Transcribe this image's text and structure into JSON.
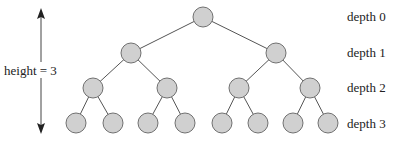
{
  "height_label": "height = 3",
  "depth_labels": [
    "depth 0",
    "depth 1",
    "depth 2",
    "depth 3"
  ],
  "colors": {
    "node_fill": "#d0d0d0",
    "node_stroke": "#707070",
    "edge": "#555555",
    "text": "#222222"
  },
  "tree": {
    "node_radius": 10,
    "levels": [
      {
        "depth": 0,
        "y": 17,
        "x": [
          203
        ]
      },
      {
        "depth": 1,
        "y": 53,
        "x": [
          131,
          276
        ]
      },
      {
        "depth": 2,
        "y": 88,
        "x": [
          93,
          167,
          239,
          310
        ]
      },
      {
        "depth": 3,
        "y": 123,
        "x": [
          76,
          113,
          148,
          185,
          222,
          258,
          293,
          328
        ]
      }
    ]
  }
}
